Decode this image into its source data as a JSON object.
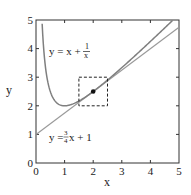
{
  "chart_data": {
    "type": "line",
    "title": "",
    "xlabel": "x",
    "ylabel": "y",
    "xlim": [
      0,
      5
    ],
    "ylim": [
      0,
      5
    ],
    "xticks": [
      "0",
      "1",
      "2",
      "3",
      "4",
      "5"
    ],
    "yticks": [
      "0",
      "1",
      "2",
      "3",
      "4",
      "5"
    ],
    "grid": false,
    "series": [
      {
        "name": "y = x + 1/x",
        "function": "x + 1/x",
        "x_range": [
          0.2,
          5
        ],
        "color": "#7f7f7f"
      },
      {
        "name": "y = (3/4)x + 1",
        "function": "0.75*x + 1",
        "x_range": [
          0,
          5
        ],
        "color": "#9a9a9a"
      }
    ],
    "annotations": [
      {
        "type": "point",
        "x": 2,
        "y": 2.5
      },
      {
        "type": "dashed-rect",
        "x": [
          1.5,
          2.5
        ],
        "y": [
          2,
          3
        ]
      },
      {
        "type": "label",
        "text": "y = x + 1/x",
        "x": 0.45,
        "y": 3.9
      },
      {
        "type": "label",
        "text": "y = 3/4 x + 1",
        "x": 0.45,
        "y": 0.95
      }
    ]
  },
  "labels": {
    "x_axis": "x",
    "y_axis": "y",
    "curve_eq_lhs": "y = x +",
    "curve_eq_num": "1",
    "curve_eq_den": "x",
    "line_eq_lhs": "y =",
    "line_eq_num": "3",
    "line_eq_den": "4",
    "line_eq_rhs": "x + 1"
  },
  "ticks": {
    "x": [
      "0",
      "1",
      "2",
      "3",
      "4",
      "5"
    ],
    "y": [
      "0",
      "1",
      "2",
      "3",
      "4",
      "5"
    ]
  }
}
